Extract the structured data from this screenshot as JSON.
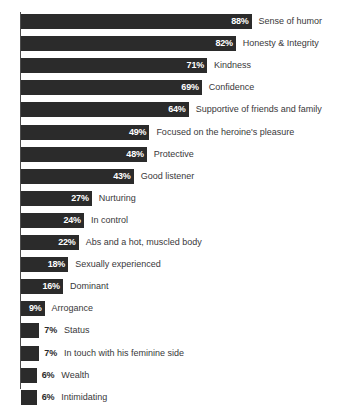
{
  "chart_data": {
    "type": "bar",
    "orientation": "horizontal",
    "title": "",
    "subtitle": "",
    "xlabel": "",
    "ylabel": "",
    "xlim": [
      0,
      100
    ],
    "grid": false,
    "legend": false,
    "value_suffix": "%",
    "colors": {
      "bar": "#2b2b2b",
      "value_inside_text": "#ffffff",
      "value_outside_text": "#2b2b2b",
      "category_text": "#39383a",
      "axis": "#4c4c4c",
      "background": "#ffffff"
    },
    "categories": [
      "Sense of humor",
      "Honesty & Integrity",
      "Kindness",
      "Confidence",
      "Supportive of friends and family",
      "Focused on the heroine's pleasure",
      "Protective",
      "Good listener",
      "Nurturing",
      "In control",
      "Abs and a hot, muscled body",
      "Sexually experienced",
      "Dominant",
      "Arrogance",
      "Status",
      "In touch with his feminine side",
      "Wealth",
      "Intimidating"
    ],
    "values": [
      88,
      82,
      71,
      69,
      64,
      49,
      48,
      43,
      27,
      24,
      22,
      18,
      16,
      9,
      7,
      7,
      6,
      6
    ],
    "value_labels": [
      "88%",
      "82%",
      "71%",
      "69%",
      "64%",
      "49%",
      "48%",
      "43%",
      "27%",
      "24%",
      "22%",
      "18%",
      "16%",
      "9%",
      "7%",
      "7%",
      "6%",
      "6%"
    ],
    "label_placement": [
      "inside",
      "inside",
      "inside",
      "inside",
      "inside",
      "inside",
      "inside",
      "inside",
      "inside",
      "inside",
      "inside",
      "inside",
      "inside",
      "inside",
      "outside",
      "outside",
      "outside",
      "outside"
    ]
  }
}
